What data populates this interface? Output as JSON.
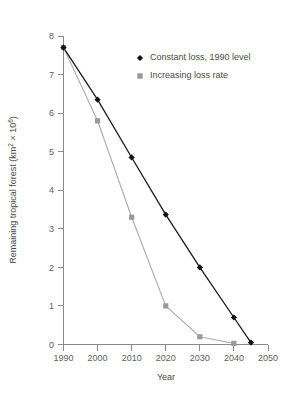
{
  "chart_data": {
    "type": "line",
    "title": "",
    "xlabel": "Year",
    "ylabel": "Remaining tropical forest (km² × 10⁶)",
    "ylabel_parts": {
      "main": "Remaining tropical forest (km",
      "sup1": "2",
      "mid": " × 10",
      "sup2": "6",
      "end": ")"
    },
    "x": [
      1990,
      2000,
      2010,
      2020,
      2030,
      2040,
      2045
    ],
    "xlim": [
      1990,
      2050
    ],
    "ylim": [
      0,
      8
    ],
    "xticks": [
      1990,
      2000,
      2010,
      2020,
      2030,
      2040,
      2050
    ],
    "yticks": [
      0,
      1,
      2,
      3,
      4,
      5,
      6,
      7,
      8
    ],
    "grid": false,
    "legend_position": "upper-center",
    "series": [
      {
        "name": "Constant loss, 1990 level",
        "marker": "diamond",
        "color": "#111111",
        "line_color": "#1a1a1a",
        "x": [
          1990,
          2000,
          2010,
          2020,
          2030,
          2040,
          2045
        ],
        "values": [
          7.7,
          6.35,
          4.85,
          3.37,
          2.0,
          0.7,
          0.05
        ]
      },
      {
        "name": "Increasing loss rate",
        "marker": "square",
        "color": "#9a9a9a",
        "line_color": "#b0b0b0",
        "x": [
          1990,
          2000,
          2010,
          2020,
          2030,
          2040
        ],
        "values": [
          7.7,
          5.8,
          3.3,
          1.0,
          0.2,
          0.03
        ]
      }
    ]
  },
  "legend": {
    "items": [
      {
        "label": "Constant loss, 1990 level",
        "marker": "diamond-marker",
        "color": "#111111"
      },
      {
        "label": "Increasing loss rate",
        "marker": "square-marker",
        "color": "#9a9a9a"
      }
    ]
  }
}
